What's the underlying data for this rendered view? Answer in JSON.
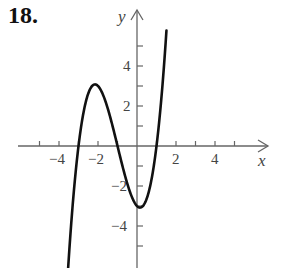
{
  "problem": {
    "number": "18."
  },
  "chart_data": {
    "type": "line",
    "title": "",
    "xlabel": "x",
    "ylabel": "y",
    "xlim": [
      -6,
      6.8
    ],
    "ylim": [
      -6,
      7
    ],
    "grid": false,
    "x_tick_labels": [
      "-4",
      "-2",
      "2",
      "4"
    ],
    "y_tick_labels": [
      "4",
      "2",
      "-2",
      "-4"
    ],
    "x_ticks": [
      -5,
      -4,
      -3,
      -2,
      -1,
      1,
      2,
      3,
      4,
      5
    ],
    "y_ticks": [
      -5,
      -4,
      -3,
      -2,
      -1,
      1,
      2,
      3,
      4,
      5
    ],
    "series": [
      {
        "name": "f(x) = x^3 + 3x^2 - x - 3",
        "x": [
          -3.5,
          -3.0,
          -2.5,
          -2.0,
          -1.5,
          -1.0,
          -0.5,
          0.0,
          0.33,
          0.5,
          1.0,
          1.25,
          1.45
        ],
        "values": [
          -5.63,
          0.0,
          2.63,
          3.0,
          1.88,
          0.0,
          -1.88,
          -3.0,
          -3.17,
          -3.13,
          0.0,
          2.38,
          4.0
        ]
      }
    ],
    "annotations": [
      {
        "label": "local max",
        "x": -2,
        "y": 3
      },
      {
        "label": "local min",
        "x": 0.15,
        "y": -3.08
      },
      {
        "label": "x-intercepts",
        "x": [
          -3,
          -1,
          1
        ]
      }
    ]
  },
  "labels": {
    "x_axis": "x",
    "y_axis": "y",
    "xt_m4": "−4",
    "xt_m2": "−2",
    "xt_2": "2",
    "xt_4": "4",
    "yt_4": "4",
    "yt_2": "2",
    "yt_m2": "−2",
    "yt_m4": "−4"
  }
}
